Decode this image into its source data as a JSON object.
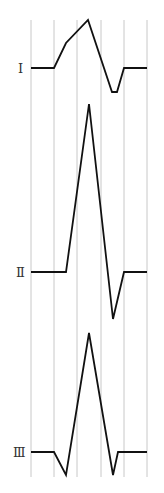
{
  "diagram": {
    "type": "ecg-lead-waveforms",
    "grid": {
      "x_positions": [
        31,
        54,
        77,
        101,
        124,
        147
      ],
      "y_top": 20,
      "y_bottom": 477,
      "color": "#c8c8c8"
    },
    "leads": [
      {
        "label": "Ⅰ",
        "label_x": 18,
        "label_y": 73,
        "points": "31,68 54,68 66,43 88,20 112,92 117,92 124,68 147,68"
      },
      {
        "label": "Ⅱ",
        "label_x": 18,
        "label_y": 277,
        "points": "31,272 66,272 89,104 113,319 124,272 147,272"
      },
      {
        "label": "Ⅲ",
        "label_x": 16,
        "label_y": 457,
        "points": "31,452 54,452 66,475 89,333 113,475 118,452 147,452"
      }
    ],
    "wave_color": "#111111"
  }
}
